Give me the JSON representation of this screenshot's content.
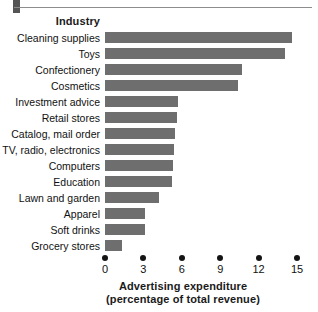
{
  "figure": {
    "top_rule_marker": "section-marker",
    "background_color": "#ffffff",
    "bar_color": "#6e6e6e",
    "text_color": "#111111"
  },
  "category_axis_title": "Industry",
  "value_axis_title_line1": "Advertising expenditure",
  "value_axis_title_line2": "(percentage of total revenue)",
  "chart_data": {
    "type": "bar",
    "orientation": "horizontal",
    "title": "",
    "subtitle": "",
    "xlabel": "Advertising expenditure (percentage of total revenue)",
    "ylabel": "Industry",
    "categories": [
      "Cleaning supplies",
      "Toys",
      "Confectionery",
      "Cosmetics",
      "Investment advice",
      "Retail stores",
      "Catalog, mail order",
      "TV, radio, electronics",
      "Computers",
      "Education",
      "Lawn and garden",
      "Apparel",
      "Soft drinks",
      "Grocery stores"
    ],
    "values": [
      14.6,
      14.1,
      10.7,
      10.4,
      5.7,
      5.6,
      5.5,
      5.4,
      5.3,
      5.2,
      4.2,
      3.1,
      3.1,
      1.3
    ],
    "xlim": [
      0,
      15
    ],
    "xticks": [
      0,
      3,
      6,
      9,
      12,
      15
    ],
    "xtick_labels": [
      "0",
      "3",
      "6",
      "9",
      "12",
      "15"
    ],
    "grid": false,
    "legend": false,
    "legend_position": "none"
  }
}
